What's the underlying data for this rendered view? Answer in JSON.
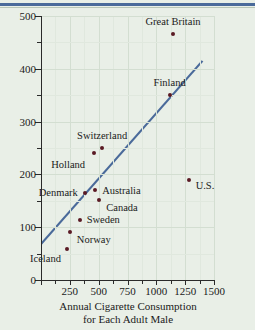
{
  "chart_data": {
    "type": "scatter",
    "title": "",
    "xlabel": "Annual Cigarette Consumption for Each Adult Male",
    "xlabel_line1": "Annual Cigarette Consumption",
    "xlabel_line2": "for Each Adult Male",
    "ylabel": "Deaths per Million Males from Lung Cancer",
    "xlim": [
      0,
      1500
    ],
    "ylim": [
      0,
      500
    ],
    "xticks": [
      250,
      500,
      750,
      1000,
      1250,
      1500
    ],
    "yticks": [
      0,
      100,
      200,
      300,
      400,
      500
    ],
    "x_minor_step": 125,
    "y_minor_step": 50,
    "grid": true,
    "legend": "none",
    "point_color": "#5a1a24",
    "line_color": "#4a6a9a",
    "background_color": "#e9efe7",
    "points": [
      {
        "label": "Great Britain",
        "x": 1145,
        "y": 465,
        "label_dx": 0,
        "label_dy": -12,
        "label_anchor": "center"
      },
      {
        "label": "Finland",
        "x": 1115,
        "y": 350,
        "label_dx": 0,
        "label_dy": -12,
        "label_anchor": "center"
      },
      {
        "label": "U.S.",
        "x": 1280,
        "y": 190,
        "label_dx": 7,
        "label_dy": 6,
        "label_anchor": "left"
      },
      {
        "label": "Switzerland",
        "x": 530,
        "y": 250,
        "label_dx": 0,
        "label_dy": -12,
        "label_anchor": "center"
      },
      {
        "label": "Holland",
        "x": 460,
        "y": 240,
        "label_dx": -9,
        "label_dy": 12,
        "label_anchor": "right"
      },
      {
        "label": "Denmark",
        "x": 380,
        "y": 165,
        "label_dx": -7,
        "label_dy": 0,
        "label_anchor": "right"
      },
      {
        "label": "Australia",
        "x": 470,
        "y": 170,
        "label_dx": 7,
        "label_dy": 1,
        "label_anchor": "left"
      },
      {
        "label": "Canada",
        "x": 505,
        "y": 152,
        "label_dx": 7,
        "label_dy": 8,
        "label_anchor": "left"
      },
      {
        "label": "Sweden",
        "x": 335,
        "y": 113,
        "label_dx": 7,
        "label_dy": 0,
        "label_anchor": "left"
      },
      {
        "label": "Norway",
        "x": 250,
        "y": 90,
        "label_dx": 7,
        "label_dy": 8,
        "label_anchor": "left"
      },
      {
        "label": "Iceland",
        "x": 225,
        "y": 58,
        "label_dx": -6,
        "label_dy": 10,
        "label_anchor": "right"
      }
    ],
    "trend_line": {
      "x1": 0,
      "y1": 68,
      "x2": 1400,
      "y2": 415
    }
  }
}
